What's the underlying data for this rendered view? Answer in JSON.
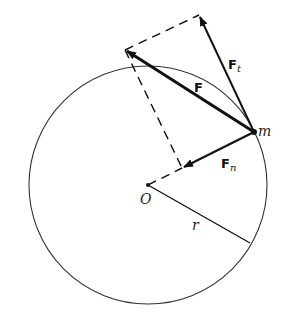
{
  "diagram": {
    "colors": {
      "stroke": "#111111",
      "circle": "#333333",
      "background": "#ffffff"
    },
    "circle": {
      "cx": 148,
      "cy": 185,
      "r": 119
    },
    "points": {
      "O": {
        "x": 148,
        "y": 185,
        "label": "O"
      },
      "m": {
        "x": 254,
        "y": 132,
        "label": "m"
      }
    },
    "vectors": [
      {
        "name": "F",
        "label": "F",
        "from": [
          254,
          132
        ],
        "to": [
          125,
          50
        ],
        "bold": true
      },
      {
        "name": "Ft",
        "label": "F",
        "subscript": "t",
        "from": [
          254,
          132
        ],
        "to": [
          199,
          15
        ]
      },
      {
        "name": "Fn",
        "label": "F",
        "subscript": "n",
        "from": [
          254,
          132
        ],
        "to": [
          182,
          168
        ]
      }
    ],
    "dashed_lines": [
      {
        "from": [
          125,
          50
        ],
        "to": [
          199,
          15
        ]
      },
      {
        "from": [
          125,
          50
        ],
        "to": [
          182,
          168
        ]
      },
      {
        "from": [
          148,
          185
        ],
        "to": [
          182,
          168
        ]
      }
    ],
    "radius_line": {
      "from": [
        148,
        185
      ],
      "to": [
        250,
        243
      ],
      "label": "r"
    },
    "labels": {
      "F": "F",
      "Ft_main": "F",
      "Ft_sub": "t",
      "Fn_main": "F",
      "Fn_sub": "n",
      "m": "m",
      "O": "O",
      "r": "r"
    }
  }
}
